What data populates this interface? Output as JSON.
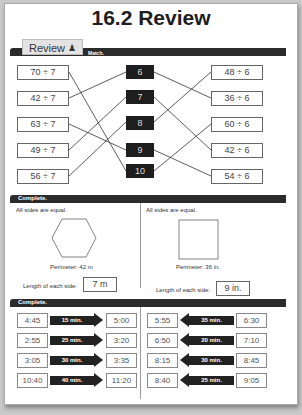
{
  "title": "16.2 Review",
  "review_tab": {
    "label": "Review",
    "icon": "person-icon"
  },
  "sections": {
    "match": {
      "instruction": "Match.",
      "left_expressions": [
        "70 ÷ 7",
        "42 ÷ 7",
        "63 ÷ 7",
        "49 ÷ 7",
        "56 ÷ 7"
      ],
      "answers": [
        "6",
        "7",
        "8",
        "9",
        "10"
      ],
      "right_expressions": [
        "48 ÷ 6",
        "36 ÷ 6",
        "60 ÷ 6",
        "42 ÷ 6",
        "54 ÷ 6"
      ],
      "left_links": [
        4,
        0,
        3,
        1,
        2
      ],
      "right_links": [
        1,
        3,
        0,
        4,
        2
      ]
    },
    "perimeter": {
      "instruction": "Complete.",
      "problems": [
        {
          "note": "All sides are equal.",
          "shape": "hexagon",
          "perimeter": "Perimeter: 42 m",
          "side_label": "Length of each side:",
          "answer": "7 m"
        },
        {
          "note": "All sides are equal.",
          "shape": "square",
          "perimeter": "Perimeter: 36 in.",
          "side_label": "Length of each side:",
          "answer": "9 in."
        }
      ]
    },
    "elapsed_time": {
      "instruction": "Complete.",
      "forward": [
        {
          "start": "4:45",
          "duration": "15 min.",
          "end": "5:00"
        },
        {
          "start": "2:55",
          "duration": "25 min.",
          "end": "3:20"
        },
        {
          "start": "3:05",
          "duration": "30 min.",
          "end": "3:35"
        },
        {
          "start": "10:40",
          "duration": "40 min.",
          "end": "11:20"
        }
      ],
      "backward": [
        {
          "start": "5:55",
          "duration": "35 min.",
          "end": "6:30"
        },
        {
          "start": "6:50",
          "duration": "20 min.",
          "end": "7:10"
        },
        {
          "start": "8:15",
          "duration": "30 min.",
          "end": "8:45"
        },
        {
          "start": "8:40",
          "duration": "25 min.",
          "end": "9:05"
        }
      ]
    }
  }
}
